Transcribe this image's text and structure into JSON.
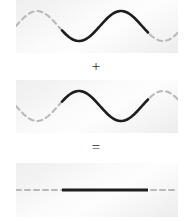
{
  "figure": {
    "width": 192,
    "height": 221,
    "background": "#ffffff"
  },
  "operators": {
    "plus": "+",
    "equals": "="
  },
  "style": {
    "dashed_color": "#b9b9b9",
    "solid_color": "#1e1e1e",
    "panel_bg_light": "#fdfdfd",
    "panel_bg_dark": "#ebebeb",
    "dashed_width": 2.1,
    "solid_width": 2.6,
    "dash_pattern": "5 4"
  },
  "panels": [
    {
      "id": "wave-1",
      "label": "First wave",
      "baseline_y": 26,
      "amplitude": 15,
      "wavelength": 84,
      "phase_deg": 0,
      "solid_start_x": 46,
      "solid_end_x": 132,
      "dashed_full_width": true
    },
    {
      "id": "wave-2",
      "label": "Second wave, inverted",
      "baseline_y": 26,
      "amplitude": 15,
      "wavelength": 84,
      "phase_deg": 180,
      "solid_start_x": 46,
      "solid_end_x": 132,
      "dashed_full_width": true
    },
    {
      "id": "wave-sum",
      "label": "Resulting flat line",
      "baseline_y": 27,
      "amplitude": 0,
      "wavelength": 84,
      "phase_deg": 0,
      "solid_start_x": 46,
      "solid_end_x": 132,
      "dashed_full_width": true
    }
  ],
  "chart_data": {
    "type": "line",
    "xlabel": "",
    "ylabel": "",
    "x": [
      0,
      10.5,
      21,
      31.5,
      42,
      52.5,
      63,
      73.5,
      84,
      94.5,
      105,
      115.5,
      126,
      136.5,
      147,
      157.5,
      162
    ],
    "series": [
      {
        "name": "Wave 1",
        "panel": 1,
        "amplitude": 15,
        "phase_deg": 0,
        "values": [
          0,
          10.6,
          15,
          10.6,
          0,
          -10.6,
          -15,
          -10.6,
          0,
          10.6,
          15,
          10.6,
          0,
          -10.6,
          -15,
          -10.6,
          -7.1
        ]
      },
      {
        "name": "Wave 2",
        "panel": 2,
        "amplitude": 15,
        "phase_deg": 180,
        "values": [
          0,
          -10.6,
          -15,
          -10.6,
          0,
          10.6,
          15,
          10.6,
          0,
          -10.6,
          -15,
          -10.6,
          0,
          10.6,
          15,
          10.6,
          7.1
        ]
      },
      {
        "name": "Sum (Wave 1 + Wave 2)",
        "panel": 3,
        "amplitude": 0,
        "phase_deg": 0,
        "values": [
          0,
          0,
          0,
          0,
          0,
          0,
          0,
          0,
          0,
          0,
          0,
          0,
          0,
          0,
          0,
          0,
          0
        ]
      }
    ],
    "ylim": [
      -20,
      20
    ],
    "xlim": [
      0,
      162
    ],
    "grid": false,
    "legend": "none"
  }
}
